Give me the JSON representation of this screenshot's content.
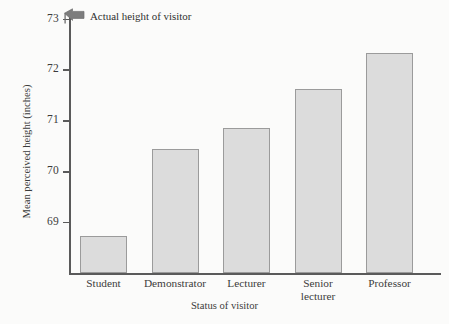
{
  "chart_data": {
    "type": "bar",
    "title": "",
    "xlabel": "Status of visitor",
    "ylabel": "Mean perceived height (inches)",
    "categories": [
      "Student",
      "Demonstrator",
      "Lecturer",
      "Senior\nlecturer",
      "Professor"
    ],
    "values": [
      68.73,
      70.43,
      70.84,
      71.62,
      72.33
    ],
    "ylim": [
      68.0,
      73.05
    ],
    "yticks": [
      69,
      70,
      71,
      72,
      73
    ],
    "ytick_labels": [
      "69",
      "70",
      "71",
      "72",
      "73"
    ],
    "grid": false,
    "legend": null,
    "annotations": [
      {
        "name": "actual-height-marker",
        "text": "Actual height of visitor",
        "icon": "left-arrow-icon",
        "y_value": 73
      }
    ],
    "colors": {
      "bar_fill": "#dcdcdc",
      "bar_stroke": "#9b9b9b",
      "axis": "#5a5a5a",
      "text": "#3b3b3b",
      "background": "#fbfbfa",
      "arrow": "#7d7d7d"
    }
  }
}
